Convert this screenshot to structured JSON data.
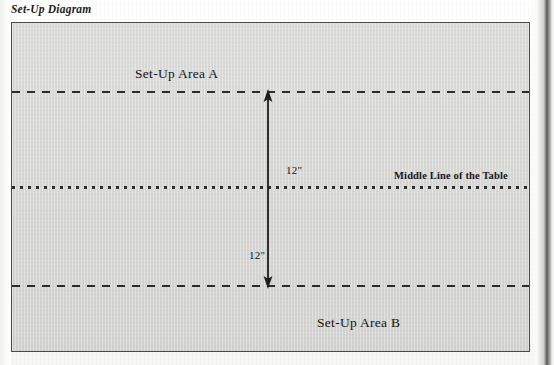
{
  "figure": {
    "caption": "Set-Up Diagram"
  },
  "diagram": {
    "zones": [
      {
        "id": "area-a",
        "label": "Set-Up Area A"
      },
      {
        "id": "area-b",
        "label": "Set-Up Area B"
      }
    ],
    "middle_line_label": "Middle Line of the Table",
    "dimensions": [
      {
        "id": "upper",
        "label": "12\""
      },
      {
        "id": "lower",
        "label": "12\""
      }
    ],
    "lines": {
      "top_boundary_style": "dashed",
      "bottom_boundary_style": "dashed",
      "middle_style": "dotted"
    },
    "arrow": {
      "style": "double-headed-vertical",
      "name": "dimension-arrow"
    },
    "colors": {
      "panel_fill": "#d6d6d4",
      "ink": "#2b2b2b",
      "border": "#4a4a48",
      "page": "#fcfcfb"
    }
  }
}
